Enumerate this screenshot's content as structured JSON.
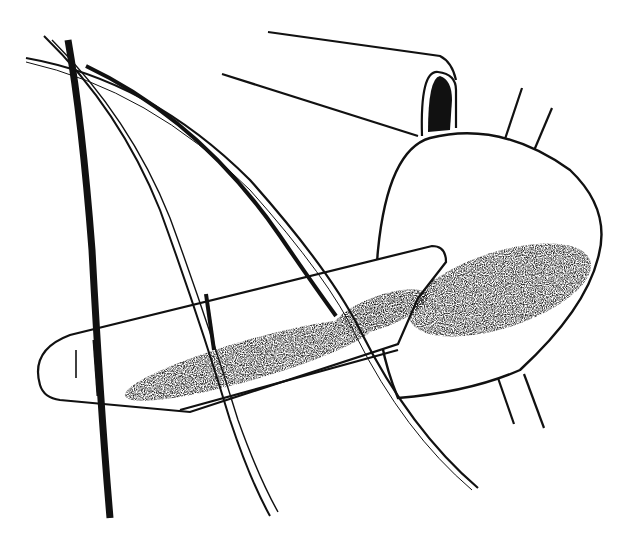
{
  "image": {
    "description": "Black and white line illustration of an aircraft propeller spinner with a blade stub and curved propeller blades",
    "colors": {
      "background": "#ffffff",
      "ink": "#111111",
      "shade": "#333333"
    }
  }
}
